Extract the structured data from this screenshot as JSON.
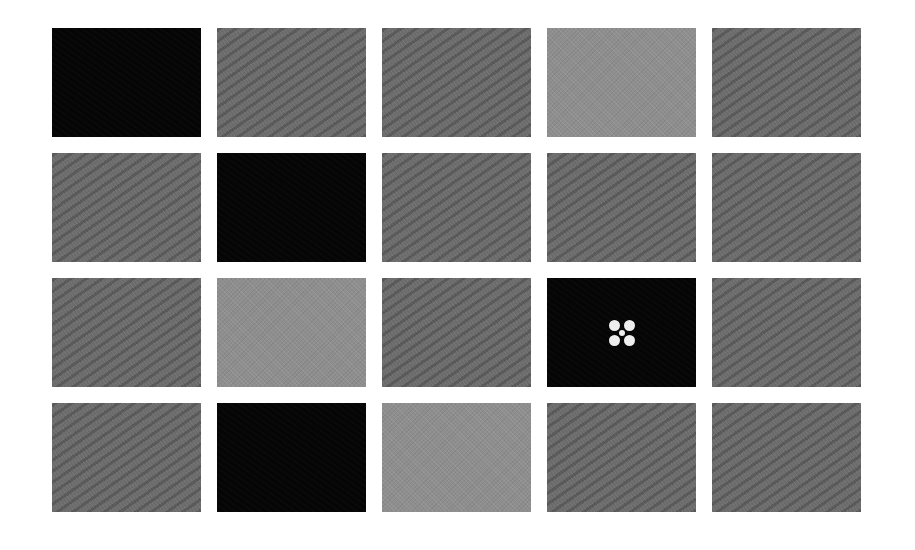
{
  "grid": {
    "rows": 4,
    "columns": 5,
    "tile_colors": {
      "black": "#050505",
      "medium": "#6b6b6b",
      "light": "#8e8e8e"
    },
    "tiles": [
      {
        "row": 1,
        "col": 1,
        "shade": "black",
        "texture": "noise"
      },
      {
        "row": 1,
        "col": 2,
        "shade": "medium",
        "texture": "diagonal-waves"
      },
      {
        "row": 1,
        "col": 3,
        "shade": "medium",
        "texture": "diagonal-waves"
      },
      {
        "row": 1,
        "col": 4,
        "shade": "light",
        "texture": "fine-noise"
      },
      {
        "row": 1,
        "col": 5,
        "shade": "medium",
        "texture": "diagonal-waves"
      },
      {
        "row": 2,
        "col": 1,
        "shade": "medium",
        "texture": "diagonal-waves"
      },
      {
        "row": 2,
        "col": 2,
        "shade": "black",
        "texture": "noise"
      },
      {
        "row": 2,
        "col": 3,
        "shade": "medium",
        "texture": "diagonal-waves"
      },
      {
        "row": 2,
        "col": 4,
        "shade": "medium",
        "texture": "diagonal-waves"
      },
      {
        "row": 2,
        "col": 5,
        "shade": "medium",
        "texture": "diagonal-waves"
      },
      {
        "row": 3,
        "col": 1,
        "shade": "medium",
        "texture": "diagonal-waves"
      },
      {
        "row": 3,
        "col": 2,
        "shade": "light",
        "texture": "fine-noise"
      },
      {
        "row": 3,
        "col": 3,
        "shade": "medium",
        "texture": "diagonal-waves"
      },
      {
        "row": 3,
        "col": 4,
        "shade": "black",
        "texture": "noise",
        "marker": "five-dot-target"
      },
      {
        "row": 3,
        "col": 5,
        "shade": "medium",
        "texture": "diagonal-waves"
      },
      {
        "row": 4,
        "col": 1,
        "shade": "medium",
        "texture": "diagonal-waves"
      },
      {
        "row": 4,
        "col": 2,
        "shade": "black",
        "texture": "noise"
      },
      {
        "row": 4,
        "col": 3,
        "shade": "light",
        "texture": "fine-noise"
      },
      {
        "row": 4,
        "col": 4,
        "shade": "medium",
        "texture": "diagonal-waves"
      },
      {
        "row": 4,
        "col": 5,
        "shade": "medium",
        "texture": "diagonal-waves"
      }
    ],
    "target_marker": {
      "icon": "five-dot-target-icon",
      "color": "#eeeeee",
      "location": {
        "row": 3,
        "col": 4
      }
    }
  }
}
